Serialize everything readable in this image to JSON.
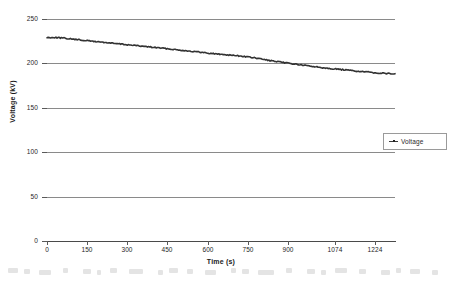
{
  "chart_data": {
    "type": "line",
    "title": "",
    "subtitle": "",
    "xlabel": "Time (s)",
    "ylabel": "Voltage (kV)",
    "xlim": [
      0,
      1300
    ],
    "ylim": [
      0,
      250
    ],
    "grid": "horizontal",
    "legend_position": "right",
    "x_ticks": [
      "0",
      "150",
      "300",
      "450",
      "600",
      "750",
      "900",
      "1074",
      "1224"
    ],
    "x_tick_values": [
      0,
      150,
      300,
      450,
      600,
      750,
      900,
      1074,
      1224
    ],
    "y_ticks": [
      "0",
      "50",
      "100",
      "150",
      "200",
      "250"
    ],
    "y_tick_values": [
      0,
      50,
      100,
      150,
      200,
      250
    ],
    "series": [
      {
        "name": "Voltage",
        "marker": "dot-line",
        "color": "#333333",
        "x": [
          0,
          25,
          50,
          75,
          100,
          125,
          150,
          175,
          200,
          225,
          250,
          275,
          300,
          325,
          350,
          375,
          400,
          425,
          450,
          475,
          500,
          525,
          550,
          575,
          600,
          625,
          650,
          675,
          700,
          725,
          750,
          775,
          800,
          825,
          850,
          875,
          900,
          925,
          950,
          975,
          1000,
          1025,
          1050,
          1074,
          1100,
          1125,
          1150,
          1175,
          1200,
          1224,
          1250,
          1275,
          1300
        ],
        "values": [
          229.0,
          229.3,
          228.8,
          228.0,
          227.2,
          226.4,
          225.6,
          224.8,
          224.1,
          223.3,
          222.5,
          221.8,
          221.0,
          220.3,
          219.5,
          218.8,
          218.0,
          217.3,
          216.5,
          215.7,
          214.9,
          214.1,
          213.3,
          212.5,
          211.7,
          210.9,
          210.2,
          209.6,
          209.0,
          208.2,
          207.3,
          206.2,
          205.0,
          203.6,
          202.3,
          201.2,
          200.3,
          199.3,
          198.2,
          197.2,
          196.3,
          195.4,
          194.6,
          193.8,
          193.0,
          192.3,
          191.5,
          190.8,
          190.1,
          189.5,
          189.0,
          188.6,
          188.3
        ]
      }
    ],
    "annotations": []
  },
  "legend": {
    "entries": [
      {
        "label": "Voltage",
        "marker_name": "line-dot-marker"
      }
    ]
  },
  "axes": {
    "x_title": "Time (s)",
    "y_title": "Voltage (kV)"
  },
  "colors": {
    "series": "#333333",
    "grid": "#8a8a8a",
    "axis": "#4a4a4a",
    "text": "#262626",
    "background": "#ffffff"
  }
}
